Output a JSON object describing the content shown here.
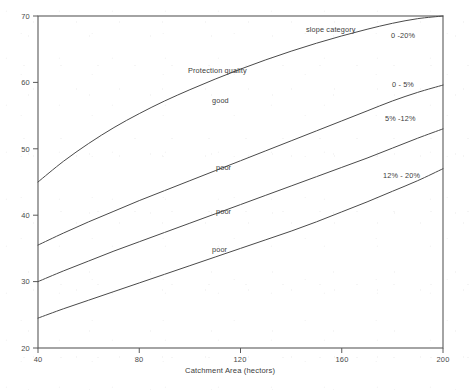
{
  "chart_data": {
    "type": "line",
    "title": "",
    "xlabel": "Catchment Area (hectors)",
    "ylabel": "",
    "xlim": [
      40,
      200
    ],
    "ylim": [
      20,
      70
    ],
    "xticks": [
      "40",
      "80",
      "120",
      "160",
      "200"
    ],
    "yticks": [
      "20",
      "30",
      "40",
      "50",
      "60",
      "70"
    ],
    "grid": false,
    "legend_position": "inline-right-of-curves",
    "annotations": [
      {
        "id": "slope-category",
        "text": "slope category"
      },
      {
        "id": "protection-quality",
        "text": "Protection quality"
      },
      {
        "id": "good",
        "text": "good"
      },
      {
        "id": "poor-upper",
        "text": "poor"
      },
      {
        "id": "poor-middle",
        "text": "poor"
      },
      {
        "id": "poor-lower",
        "text": "poor"
      }
    ],
    "series": [
      {
        "name": "0 -20%",
        "label": "0 -20%",
        "x": [
          40,
          50,
          60,
          70,
          80,
          90,
          100,
          110,
          120,
          130,
          140,
          150,
          160,
          170,
          180,
          190,
          200
        ],
        "y": [
          45.0,
          48.1,
          50.8,
          53.2,
          55.3,
          57.2,
          58.9,
          60.5,
          62.0,
          63.4,
          64.7,
          65.9,
          67.0,
          68.0,
          68.9,
          69.6,
          70.0
        ]
      },
      {
        "name": "0 - 5%",
        "label": "0 - 5%",
        "x": [
          40,
          50,
          60,
          70,
          80,
          90,
          100,
          110,
          120,
          130,
          140,
          150,
          160,
          170,
          180,
          190,
          200
        ],
        "y": [
          35.5,
          37.3,
          39.0,
          40.6,
          42.2,
          43.7,
          45.2,
          46.7,
          48.2,
          49.7,
          51.2,
          52.7,
          54.2,
          55.7,
          57.2,
          58.5,
          59.6
        ]
      },
      {
        "name": "5% -12%",
        "label": "5% -12%",
        "x": [
          40,
          50,
          60,
          70,
          80,
          90,
          100,
          110,
          120,
          130,
          140,
          150,
          160,
          170,
          180,
          190,
          200
        ],
        "y": [
          30.0,
          31.6,
          33.1,
          34.6,
          36.0,
          37.4,
          38.8,
          40.2,
          41.6,
          43.0,
          44.4,
          45.8,
          47.2,
          48.6,
          50.1,
          51.6,
          53.0
        ]
      },
      {
        "name": "12% - 20%",
        "label": "12% - 20%",
        "x": [
          40,
          50,
          60,
          70,
          80,
          90,
          100,
          110,
          120,
          130,
          140,
          150,
          160,
          170,
          180,
          190,
          200
        ],
        "y": [
          24.5,
          25.9,
          27.2,
          28.5,
          29.8,
          31.1,
          32.4,
          33.7,
          35.0,
          36.3,
          37.6,
          39.0,
          40.5,
          42.0,
          43.6,
          45.2,
          47.0
        ]
      }
    ]
  },
  "axes": {
    "x_title": "Catchment Area (hectors)",
    "x_tick_labels": [
      "40",
      "80",
      "120",
      "160",
      "200"
    ],
    "y_tick_labels": [
      "70",
      "60",
      "50",
      "40",
      "30",
      "20"
    ]
  },
  "labels": {
    "slope_category": "slope category",
    "protection_quality": "Protection quality",
    "good": "good",
    "poor_upper": "poor",
    "poor_middle": "poor",
    "poor_lower": "poor",
    "series_0": "0 -20%",
    "series_1": "0 - 5%",
    "series_2": "5% -12%",
    "series_3": "12% - 20%"
  },
  "colors": {
    "background": "#ffffff",
    "line": "#4a4a4a",
    "frame": "#5a5a5a",
    "text": "#3c3c3c"
  }
}
